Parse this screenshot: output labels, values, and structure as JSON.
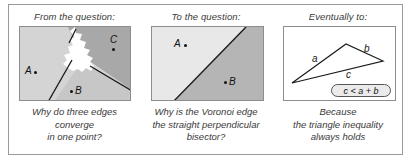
{
  "figure": {
    "panels": [
      {
        "id": "from-the-question",
        "heading": "From the question:",
        "diagram": {
          "kind": "voronoi-three-cells",
          "sites": [
            {
              "label": "A",
              "label_side": "left"
            },
            {
              "label": "B",
              "label_side": "right"
            },
            {
              "label": "C",
              "label_side": "above"
            }
          ]
        },
        "caption_lines": [
          "Why do three edges",
          "converge",
          "in one point?"
        ]
      },
      {
        "id": "to-the-question",
        "heading": "To the question:",
        "diagram": {
          "kind": "voronoi-two-cells",
          "sites": [
            {
              "label": "A",
              "label_side": "left"
            },
            {
              "label": "B",
              "label_side": "right"
            }
          ]
        },
        "caption_lines": [
          "Why is the Voronoi edge",
          "the straight perpendicular",
          "bisector?"
        ]
      },
      {
        "id": "eventually-to",
        "heading": "Eventually to:",
        "diagram": {
          "kind": "triangle-inequality",
          "edge_labels": [
            "a",
            "b",
            "c"
          ],
          "inequality": "c < a + b"
        },
        "caption_lines": [
          "Because",
          "the triangle inequality",
          "always holds"
        ]
      }
    ]
  },
  "colors": {
    "outer_border": "#9a9a9a",
    "panel_border": "#8d8d8d",
    "cell_light": "#d6d6d6",
    "cell_mid": "#c9c9c9",
    "cell_dark": "#a6a6a6",
    "cell_white": "#ffffff",
    "text": "#3a3a3a",
    "ink": "#111111",
    "badge_fill": "#ebebeb"
  }
}
